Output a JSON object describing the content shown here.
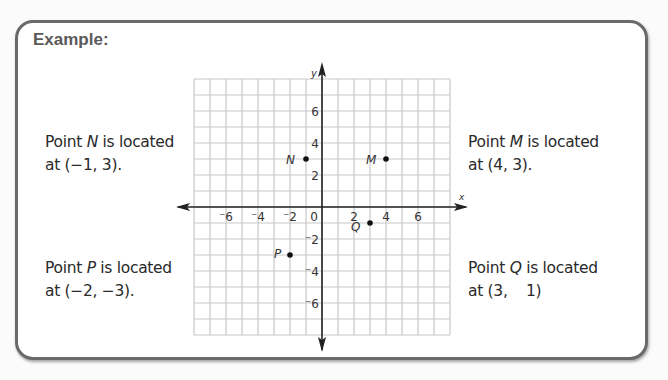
{
  "card": {
    "title": "Example:"
  },
  "notes": [
    {
      "id": "N",
      "prefix": "Point ",
      "point": "N",
      "suffix": " is located",
      "line2": "at (−1, 3)."
    },
    {
      "id": "M",
      "prefix": "Point ",
      "point": "M",
      "suffix": " is located",
      "line2": "at (4, 3)."
    },
    {
      "id": "P",
      "prefix": "Point ",
      "point": "P",
      "suffix": " is located",
      "line2": "at (−2, −3)."
    },
    {
      "id": "Q",
      "prefix": "Point ",
      "point": "Q",
      "suffix": " is located",
      "line2": "at (3,    1)"
    }
  ],
  "chart_data": {
    "type": "scatter",
    "title": "Example:",
    "xlabel": "x",
    "ylabel": "y",
    "xlim": [
      -8,
      8
    ],
    "ylim": [
      -8,
      8
    ],
    "grid": true,
    "grid_step": 1,
    "x_ticks": [
      -6,
      -4,
      -2,
      0,
      2,
      4,
      6
    ],
    "x_tick_labels": [
      "⁻6",
      "⁻4",
      "⁻2",
      "0",
      "2",
      "4",
      "6"
    ],
    "y_ticks": [
      6,
      4,
      2,
      -2,
      -4,
      -6
    ],
    "y_tick_labels": [
      "6",
      "4",
      "2",
      "⁻2",
      "⁻4",
      "⁻6"
    ],
    "points": [
      {
        "label": "N",
        "x": -1,
        "y": 3
      },
      {
        "label": "M",
        "x": 4,
        "y": 3
      },
      {
        "label": "Q",
        "x": 3,
        "y": -1
      },
      {
        "label": "P",
        "x": -2,
        "y": -3
      }
    ],
    "colors": {
      "grid": "#c8c8c8",
      "axis": "#222222",
      "point": "#111111"
    }
  }
}
